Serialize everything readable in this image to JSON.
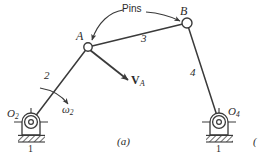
{
  "figure": {
    "caption": "(a)",
    "neighbor_caption_fragment": "(",
    "ink_color": "#3a3a3a",
    "background": "#ffffff"
  },
  "annotations": {
    "pins_label": "Pins",
    "velocity_label_main": "V",
    "velocity_label_sub": "A",
    "omega_label_main": "ω",
    "omega_label_sub": "2"
  },
  "joints": [
    {
      "name": "A",
      "label": "A",
      "x": 88,
      "y": 47,
      "r": 4.2,
      "type": "pin"
    },
    {
      "name": "B",
      "label": "B",
      "x": 187,
      "y": 23,
      "r": 5.0,
      "type": "pin"
    }
  ],
  "pivots": [
    {
      "name": "O2",
      "label_main": "O",
      "label_sub": "2",
      "x": 31,
      "y": 122,
      "ground_label": "1"
    },
    {
      "name": "O4",
      "label_main": "O",
      "label_sub": "4",
      "x": 219,
      "y": 122,
      "ground_label": "1"
    }
  ],
  "links": [
    {
      "number": "2",
      "name": "crank",
      "from": "O2",
      "to": "A",
      "label_x": 46,
      "label_y": 76
    },
    {
      "number": "3",
      "name": "coupler",
      "from": "A",
      "to": "B",
      "label_x": 143,
      "label_y": 39
    },
    {
      "number": "4",
      "name": "rocker",
      "from": "B",
      "to": "O4",
      "label_x": 192,
      "label_y": 73
    },
    {
      "number": "1",
      "name": "ground",
      "from": "O2",
      "to": "O4",
      "label_x": 0,
      "label_y": 0
    }
  ]
}
